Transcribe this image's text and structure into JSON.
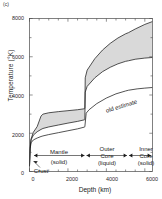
{
  "panel": {
    "label": "(c)"
  },
  "axes": {
    "ylabel": "Temperature  (°K)",
    "xlabel": "Depth   (km)",
    "yticks": [
      "0",
      "2000",
      "4000",
      "6000",
      "8000"
    ],
    "xticks": [
      "0",
      "2000",
      "4000",
      "6000"
    ],
    "ylim": [
      0,
      8000
    ],
    "xlim": [
      0,
      6400
    ]
  },
  "annotations": {
    "old_estimate": "old estimate",
    "crust": "Crust",
    "mantle_line1": "Mantle",
    "mantle_line2": "(solid)",
    "outer_line1": "Outer",
    "outer_line2": "Core",
    "outer_line3": "(liquid)",
    "inner_line1": "Inner",
    "inner_line2": "Core",
    "inner_line3": "(solid)"
  },
  "colors": {
    "band_fill": "#d9d9d9",
    "curve": "#1a1a1a",
    "axis": "#4a4a4a"
  },
  "chart_data": {
    "type": "line",
    "title": "",
    "xlabel": "Depth (km)",
    "ylabel": "Temperature (°K)",
    "xlim": [
      0,
      6400
    ],
    "ylim": [
      0,
      8000
    ],
    "grid": false,
    "legend": "none",
    "series": [
      {
        "name": "upper bound (modern estimate)",
        "x": [
          0,
          30,
          80,
          200,
          400,
          600,
          700,
          1000,
          1500,
          2000,
          2500,
          2850,
          2880,
          2900,
          3000,
          3400,
          3800,
          4200,
          4600,
          5000,
          5150,
          5500,
          6000,
          6371
        ],
        "values": [
          300,
          1200,
          1700,
          2050,
          2350,
          2900,
          3000,
          3070,
          3130,
          3180,
          3230,
          3280,
          3300,
          4900,
          5300,
          5900,
          6350,
          6700,
          6980,
          7200,
          7260,
          7450,
          7690,
          7830
        ]
      },
      {
        "name": "lower bound (modern estimate)",
        "x": [
          0,
          30,
          80,
          200,
          400,
          600,
          700,
          1000,
          1500,
          2000,
          2500,
          2850,
          2880,
          2900,
          3000,
          3400,
          3800,
          4200,
          4600,
          5000,
          5150,
          5500,
          6000,
          6371
        ],
        "values": [
          300,
          1200,
          1650,
          1900,
          2080,
          2200,
          2250,
          2330,
          2430,
          2530,
          2620,
          2700,
          2720,
          4150,
          4450,
          4900,
          5220,
          5450,
          5630,
          5760,
          5790,
          5870,
          5930,
          5960
        ]
      },
      {
        "name": "old estimate",
        "x": [
          0,
          30,
          80,
          200,
          400,
          600,
          700,
          1000,
          1500,
          2000,
          2500,
          2850,
          2880,
          2950,
          3100,
          3500,
          4000,
          4500,
          5000,
          5150,
          5600,
          6000,
          6371
        ],
        "values": [
          300,
          1150,
          1500,
          1650,
          1750,
          1830,
          1860,
          1930,
          2030,
          2130,
          2230,
          2320,
          2340,
          3050,
          3230,
          3550,
          3840,
          4060,
          4210,
          4250,
          4320,
          4360,
          4390
        ]
      }
    ],
    "band": {
      "between": [
        "upper bound (modern estimate)",
        "lower bound (modern estimate)"
      ],
      "fill": "#d9d9d9"
    },
    "layer_boundaries_km": [
      30,
      2890,
      5150,
      6371
    ],
    "layers": [
      {
        "name": "Crust",
        "state": "",
        "from_km": 0,
        "to_km": 30
      },
      {
        "name": "Mantle",
        "state": "(solid)",
        "from_km": 30,
        "to_km": 2890
      },
      {
        "name": "Outer Core",
        "state": "(liquid)",
        "from_km": 2890,
        "to_km": 5150
      },
      {
        "name": "Inner Core",
        "state": "(solid)",
        "from_km": 5150,
        "to_km": 6371
      }
    ]
  }
}
